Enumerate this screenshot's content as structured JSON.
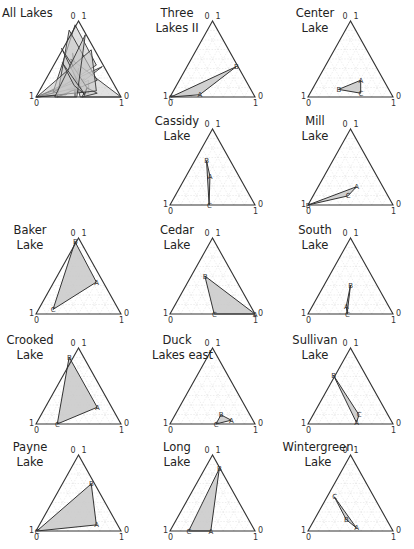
{
  "chart_data": {
    "type": "ternary",
    "corner_labels": {
      "apex": [
        "0",
        "1"
      ],
      "left": [
        "1",
        "0"
      ],
      "right": [
        "0",
        "1"
      ]
    },
    "grid": true,
    "panels": [
      {
        "id": "all",
        "title": "All Lakes",
        "row": 0,
        "col": 0,
        "composite": true
      },
      {
        "id": "three",
        "title": "Three\nLakes II",
        "row": 0,
        "col": 1,
        "points": {
          "A": [
            0.35,
            0.03
          ],
          "B": [
            0.78,
            0.4
          ],
          "C": [
            0.01,
            0.0
          ]
        },
        "order": [
          "C",
          "B",
          "A"
        ]
      },
      {
        "id": "center",
        "title": "Center\nLake",
        "row": 0,
        "col": 2,
        "points": {
          "A": [
            0.62,
            0.22
          ],
          "B": [
            0.36,
            0.1
          ],
          "C": [
            0.62,
            0.05
          ]
        },
        "order": [
          "B",
          "A",
          "C"
        ]
      },
      {
        "id": "cassidy",
        "title": "Cassidy\nLake",
        "row": 1,
        "col": 1,
        "points": {
          "A": [
            0.47,
            0.38
          ],
          "B": [
            0.43,
            0.58
          ],
          "C": [
            0.46,
            0.0
          ]
        },
        "order": [
          "B",
          "A",
          "C"
        ]
      },
      {
        "id": "mill",
        "title": "Mill\nLake",
        "row": 1,
        "col": 2,
        "points": {
          "A": [
            0.57,
            0.24
          ],
          "B": [
            0.0,
            0.0
          ],
          "C": [
            0.47,
            0.12
          ]
        },
        "order": [
          "B",
          "A",
          "C"
        ]
      },
      {
        "id": "baker",
        "title": "Baker\nLake",
        "row": 2,
        "col": 0,
        "points": {
          "A": [
            0.71,
            0.42
          ],
          "B": [
            0.46,
            0.95
          ],
          "C": [
            0.2,
            0.06
          ]
        },
        "order": [
          "B",
          "A",
          "C"
        ]
      },
      {
        "id": "cedar",
        "title": "Cedar\nLake",
        "row": 2,
        "col": 1,
        "points": {
          "A": [
            1.0,
            0.0
          ],
          "B": [
            0.41,
            0.5
          ],
          "C": [
            0.52,
            0.0
          ]
        },
        "order": [
          "B",
          "A",
          "C"
        ]
      },
      {
        "id": "south",
        "title": "South\nLake",
        "row": 2,
        "col": 2,
        "points": {
          "A": [
            0.45,
            0.1
          ],
          "B": [
            0.5,
            0.38
          ],
          "C": [
            0.46,
            0.0
          ]
        },
        "order": [
          "B",
          "A",
          "C"
        ]
      },
      {
        "id": "crooked",
        "title": "Crooked\nLake",
        "row": 3,
        "col": 0,
        "points": {
          "A": [
            0.72,
            0.22
          ],
          "B": [
            0.39,
            0.88
          ],
          "C": [
            0.25,
            0.0
          ]
        },
        "order": [
          "B",
          "A",
          "C"
        ]
      },
      {
        "id": "duck",
        "title": "Duck\nLakes east",
        "row": 3,
        "col": 1,
        "points": {
          "A": [
            0.72,
            0.05
          ],
          "B": [
            0.6,
            0.12
          ],
          "C": [
            0.54,
            0.0
          ]
        },
        "order": [
          "C",
          "B",
          "A"
        ]
      },
      {
        "id": "sullivan",
        "title": "Sullivan\nLake",
        "row": 3,
        "col": 2,
        "points": {
          "A": [
            0.57,
            0.02
          ],
          "B": [
            0.3,
            0.64
          ],
          "C": [
            0.6,
            0.12
          ]
        },
        "order": [
          "B",
          "C",
          "A"
        ]
      },
      {
        "id": "payne",
        "title": "Payne\nLake",
        "row": 4,
        "col": 0,
        "points": {
          "A": [
            0.71,
            0.08
          ],
          "B": [
            0.65,
            0.62
          ],
          "C": [
            0.01,
            0.0
          ]
        },
        "order": [
          "C",
          "B",
          "A"
        ]
      },
      {
        "id": "long",
        "title": "Long\nLake",
        "row": 4,
        "col": 1,
        "points": {
          "A": [
            0.48,
            0.0
          ],
          "B": [
            0.58,
            0.82
          ],
          "C": [
            0.22,
            0.0
          ]
        },
        "order": [
          "C",
          "B",
          "A"
        ]
      },
      {
        "id": "winter",
        "title": "Wintergreen\nLake",
        "row": 4,
        "col": 2,
        "points": {
          "A": [
            0.57,
            0.04
          ],
          "B": [
            0.45,
            0.15
          ],
          "C": [
            0.31,
            0.45
          ]
        },
        "order": [
          "C",
          "B",
          "A"
        ]
      }
    ],
    "composite_polygons": [
      [
        [
          0.01,
          0.0
        ],
        [
          0.78,
          0.4
        ],
        [
          0.35,
          0.03
        ]
      ],
      [
        [
          0.36,
          0.1
        ],
        [
          0.62,
          0.22
        ],
        [
          0.62,
          0.05
        ]
      ],
      [
        [
          0.43,
          0.58
        ],
        [
          0.47,
          0.38
        ],
        [
          0.46,
          0.0
        ]
      ],
      [
        [
          0.0,
          0.0
        ],
        [
          0.57,
          0.24
        ],
        [
          0.47,
          0.12
        ]
      ],
      [
        [
          0.46,
          0.95
        ],
        [
          0.71,
          0.42
        ],
        [
          0.2,
          0.06
        ]
      ],
      [
        [
          0.41,
          0.5
        ],
        [
          1.0,
          0.0
        ],
        [
          0.52,
          0.0
        ]
      ],
      [
        [
          0.5,
          0.38
        ],
        [
          0.45,
          0.1
        ],
        [
          0.46,
          0.0
        ]
      ],
      [
        [
          0.39,
          0.88
        ],
        [
          0.72,
          0.22
        ],
        [
          0.25,
          0.0
        ]
      ],
      [
        [
          0.54,
          0.0
        ],
        [
          0.6,
          0.12
        ],
        [
          0.72,
          0.05
        ]
      ],
      [
        [
          0.3,
          0.64
        ],
        [
          0.6,
          0.12
        ],
        [
          0.57,
          0.02
        ]
      ],
      [
        [
          0.01,
          0.0
        ],
        [
          0.65,
          0.62
        ],
        [
          0.71,
          0.08
        ]
      ],
      [
        [
          0.22,
          0.0
        ],
        [
          0.58,
          0.82
        ],
        [
          0.48,
          0.0
        ]
      ],
      [
        [
          0.31,
          0.45
        ],
        [
          0.45,
          0.15
        ],
        [
          0.57,
          0.04
        ]
      ]
    ],
    "colors": {
      "fill": "#c8c8c8",
      "stroke": "#333333",
      "frame": "#333333",
      "grid": "#e2e2e2"
    }
  },
  "layout": {
    "col_left": [
      36,
      170,
      308
    ],
    "row_base": [
      97,
      205,
      314,
      424,
      531
    ],
    "side": 85,
    "height": 76,
    "title_pos": [
      [
        4,
        14
      ],
      [
        150,
        14
      ],
      [
        292,
        14
      ]
    ]
  }
}
